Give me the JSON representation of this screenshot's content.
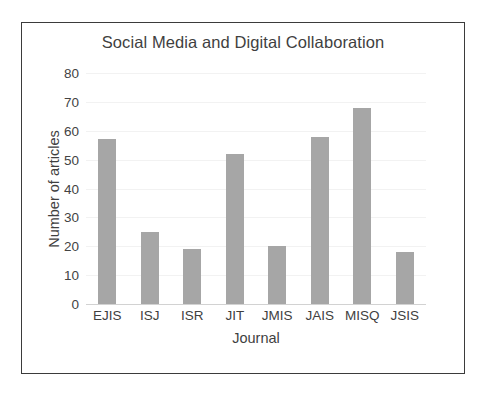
{
  "chart_data": {
    "type": "bar",
    "title": "Social Media and Digital Collaboration",
    "xlabel": "Journal",
    "ylabel": "Number of articles",
    "categories": [
      "EJIS",
      "ISJ",
      "ISR",
      "JIT",
      "JMIS",
      "JAIS",
      "MISQ",
      "JSIS"
    ],
    "values": [
      57,
      25,
      19,
      52,
      20,
      58,
      68,
      18
    ],
    "ylim": [
      0,
      80
    ],
    "ytick_labels": [
      "80",
      "70",
      "60",
      "50",
      "40",
      "30",
      "20",
      "10",
      "0"
    ],
    "ytick_values": [
      80,
      70,
      60,
      50,
      40,
      30,
      20,
      10,
      0
    ],
    "grid": true,
    "legend": false,
    "bar_color": "#a6a6a6",
    "text_color": "#3f3f3f",
    "gridline_color": "#f2f2f2",
    "border_color": "#3b3b3b",
    "background": "#ffffff"
  }
}
